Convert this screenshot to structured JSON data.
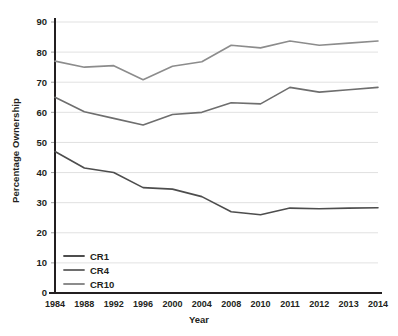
{
  "chart_data": {
    "type": "line",
    "title": "",
    "xlabel": "Year",
    "ylabel": "Percentage Ownership",
    "categories": [
      "1984",
      "1988",
      "1992",
      "1996",
      "2000",
      "2004",
      "2008",
      "2010",
      "2011",
      "2012",
      "2013",
      "2014"
    ],
    "ylim": [
      0,
      90
    ],
    "yticks": [
      "0",
      "10",
      "20",
      "30",
      "40",
      "50",
      "60",
      "70",
      "80",
      "90"
    ],
    "ytick_values": [
      0,
      10,
      20,
      30,
      40,
      50,
      60,
      70,
      80,
      90
    ],
    "grid": "horizontal",
    "legend_position": "bottom-left",
    "series": [
      {
        "name": "CR1",
        "color": "#4d4d4d",
        "values": [
          47.0,
          41.5,
          40.0,
          35.0,
          34.5,
          32.0,
          27.0,
          26.0,
          28.2,
          28.0,
          28.2,
          28.3
        ]
      },
      {
        "name": "CR4",
        "color": "#6e6e6e",
        "values": [
          65.0,
          60.2,
          58.0,
          55.8,
          59.3,
          60.0,
          63.2,
          62.8,
          68.3,
          66.7,
          67.5,
          68.3
        ]
      },
      {
        "name": "CR10",
        "color": "#8c8c8c",
        "values": [
          77.0,
          75.0,
          75.5,
          70.8,
          75.3,
          76.8,
          82.3,
          81.4,
          83.7,
          82.3,
          83.0,
          83.7
        ]
      }
    ]
  },
  "legend": {
    "items": [
      {
        "label": "CR1"
      },
      {
        "label": "CR4"
      },
      {
        "label": "CR10"
      }
    ]
  }
}
